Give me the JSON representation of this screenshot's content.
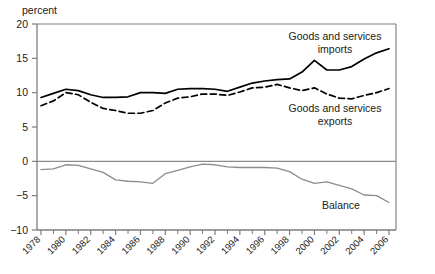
{
  "chart_data": {
    "type": "line",
    "title": "",
    "xlabel": "",
    "ylabel": "percent",
    "unit_label": "percent",
    "ylim": [
      -10,
      20
    ],
    "xlim": [
      1978,
      2006
    ],
    "y_ticks": [
      20,
      15,
      10,
      5,
      0,
      -5,
      -10
    ],
    "y_tick_labels": [
      "20",
      "15",
      "10",
      "5",
      "0",
      "−5",
      "−10"
    ],
    "x_ticks": [
      1978,
      1980,
      1982,
      1984,
      1986,
      1988,
      1990,
      1992,
      1994,
      1996,
      1998,
      2000,
      2002,
      2004,
      2006
    ],
    "x_tick_labels": [
      "1978",
      "1980",
      "1982",
      "1984",
      "1986",
      "1988",
      "1990",
      "1992",
      "1994",
      "1996",
      "1998",
      "2000",
      "2002",
      "2004",
      "2006"
    ],
    "x_minor_ticks": [
      1979,
      1981,
      1983,
      1985,
      1987,
      1989,
      1991,
      1993,
      1995,
      1997,
      1999,
      2001,
      2003,
      2005
    ],
    "grid": false,
    "legend_position": "inline-annotations",
    "zero_line": 0,
    "x": [
      1978,
      1979,
      1980,
      1981,
      1982,
      1983,
      1984,
      1985,
      1986,
      1987,
      1988,
      1989,
      1990,
      1991,
      1992,
      1993,
      1994,
      1995,
      1996,
      1997,
      1998,
      1999,
      2000,
      2001,
      2002,
      2003,
      2004,
      2005,
      2006
    ],
    "series": [
      {
        "name": "Goods and services imports",
        "label": "Goods and services imports",
        "label_line1": "Goods and services",
        "label_line2": "imports",
        "style": "solid",
        "color": "#000000",
        "width": 1.7,
        "values": [
          9.3,
          9.9,
          10.5,
          10.3,
          9.7,
          9.3,
          9.3,
          9.4,
          10.0,
          10.0,
          9.9,
          10.5,
          10.6,
          10.6,
          10.5,
          10.2,
          10.8,
          11.4,
          11.7,
          11.9,
          12.0,
          13.0,
          14.7,
          13.3,
          13.3,
          13.8,
          14.9,
          15.8,
          16.4
        ]
      },
      {
        "name": "Goods and services exports",
        "label": "Goods and services exports",
        "label_line1": "Goods and services",
        "label_line2": "exports",
        "style": "dashed",
        "color": "#000000",
        "width": 1.7,
        "values": [
          8.1,
          8.8,
          10.0,
          9.7,
          8.6,
          7.7,
          7.4,
          7.0,
          7.0,
          7.4,
          8.5,
          9.2,
          9.4,
          9.8,
          9.8,
          9.6,
          10.1,
          10.7,
          10.8,
          11.2,
          10.7,
          10.3,
          10.7,
          9.8,
          9.2,
          9.1,
          9.6,
          10.0,
          10.6
        ]
      },
      {
        "name": "Balance",
        "label": "Balance",
        "style": "solid",
        "color": "#8c8c8c",
        "width": 1.3,
        "values": [
          -1.2,
          -1.1,
          -0.5,
          -0.6,
          -1.1,
          -1.6,
          -2.7,
          -2.9,
          -3.0,
          -3.2,
          -1.8,
          -1.3,
          -0.8,
          -0.4,
          -0.5,
          -0.8,
          -0.9,
          -0.9,
          -0.9,
          -1.0,
          -1.5,
          -2.6,
          -3.2,
          -3.0,
          -3.5,
          -4.0,
          -4.9,
          -5.0,
          -6.0
        ]
      }
    ],
    "annotations": [
      {
        "name": "imports-label",
        "text": "Goods and services imports",
        "x_px": 335,
        "y_px": 40
      },
      {
        "name": "exports-label",
        "text": "Goods and services exports",
        "x_px": 335,
        "y_px": 112
      },
      {
        "name": "balance-label",
        "text": "Balance",
        "x_px": 341,
        "y_px": 209
      }
    ]
  }
}
